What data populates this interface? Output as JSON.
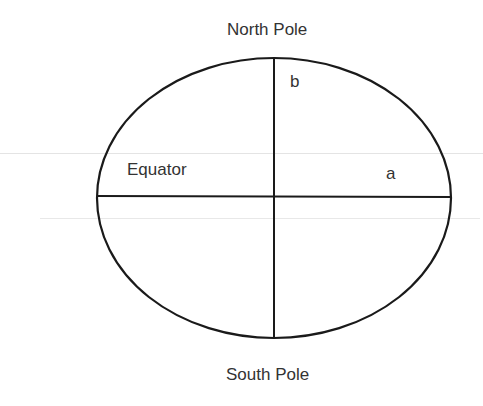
{
  "diagram": {
    "type": "ellipse-axes",
    "labels": {
      "top": "North Pole",
      "bottom": "South Pole",
      "equator": "Equator",
      "semi_minor": "b",
      "semi_major": "a"
    },
    "geometry": {
      "center": [
        274,
        197
      ],
      "rx": 177,
      "ry": 140
    },
    "colors": {
      "stroke": "#1a1a1a",
      "text": "#333333",
      "background": "#ffffff"
    }
  }
}
